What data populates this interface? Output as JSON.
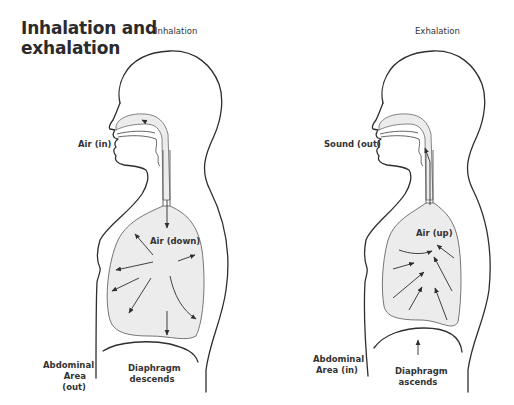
{
  "title": {
    "line1": "Inhalation and",
    "line2": "exhalation"
  },
  "panels": [
    {
      "heading": "Inhalation",
      "mouth_label": "Air (in)",
      "lung_label": "Air (down)",
      "abdomen_label_line1": "Abdominal",
      "abdomen_label_line2": "Area (out)",
      "diaphragm_label_line1": "Diaphragm",
      "diaphragm_label_line2": "descends"
    },
    {
      "heading": "Exhalation",
      "mouth_label": "Sound (out)",
      "lung_label": "Air (up)",
      "abdomen_label_line1": "Abdominal",
      "abdomen_label_line2": "Area (in)",
      "diaphragm_label_line1": "Diaphragm",
      "diaphragm_label_line2": "ascends"
    }
  ],
  "colors": {
    "outline": "#2e2e2e",
    "lung_fill": "#ececec",
    "background": "#ffffff"
  }
}
